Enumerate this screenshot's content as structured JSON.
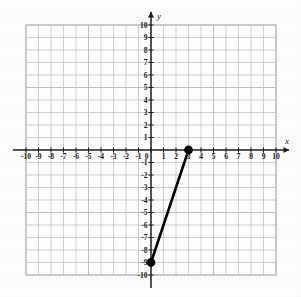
{
  "figure": {
    "background_color": "#fdfdfd",
    "grid_color": "#b9b9b9",
    "grid_minor_color": "#d8d8d8",
    "axis_color": "#1a1a1a",
    "segment_color": "#000000"
  },
  "axes": {
    "x_label": "x",
    "y_label": "y",
    "x_min": -10,
    "x_max": 10,
    "y_min": -10,
    "y_max": 10,
    "step": 1,
    "grid": true,
    "x_tick_labels": [
      "-10",
      "-9",
      "-8",
      "-7",
      "-6",
      "-5",
      "-4",
      "-3",
      "-2",
      "-1",
      "0",
      "1",
      "2",
      "3",
      "4",
      "5",
      "6",
      "7",
      "8",
      "9",
      "10"
    ],
    "y_tick_labels": [
      "10",
      "9",
      "8",
      "7",
      "6",
      "5",
      "4",
      "3",
      "2",
      "1",
      "-1",
      "-2",
      "-3",
      "-4",
      "-5",
      "-6",
      "-7",
      "-8",
      "-9",
      "-10"
    ],
    "origin_label": "0"
  },
  "chart_data": {
    "type": "line",
    "title": "",
    "xlabel": "x",
    "ylabel": "y",
    "xlim": [
      -10,
      10
    ],
    "ylim": [
      -10,
      10
    ],
    "grid": true,
    "legend": null,
    "series": [
      {
        "name": "segment",
        "x": [
          0,
          3
        ],
        "y": [
          -9,
          0
        ],
        "endpoints": [
          {
            "x": 0,
            "y": -9,
            "marker": "filled-circle"
          },
          {
            "x": 3,
            "y": 0,
            "marker": "filled-circle"
          }
        ],
        "slope": 3,
        "y_intercept": -9,
        "color": "#000000",
        "line_width": 2.6
      }
    ]
  },
  "markers": {
    "upper_point_name": "point-3-0",
    "lower_point_name": "point-0-neg9"
  }
}
